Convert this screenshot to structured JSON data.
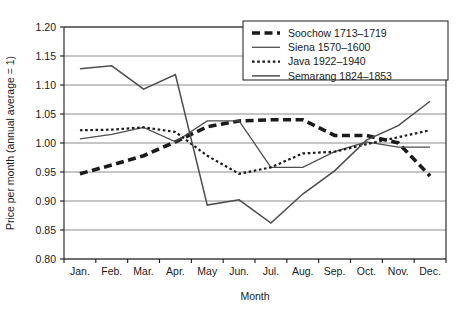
{
  "chart_data": {
    "type": "line",
    "title": "",
    "subtitle": "",
    "xlabel": "Month",
    "ylabel": "Price per month (annual average = 1)",
    "categories": [
      "Jan.",
      "Feb.",
      "Mar.",
      "Apr.",
      "May",
      "Jun.",
      "Jul.",
      "Aug.",
      "Sep.",
      "Oct.",
      "Nov.",
      "Dec."
    ],
    "ylim": [
      0.8,
      1.2
    ],
    "yticks": [
      "0.80",
      "0.85",
      "0.90",
      "0.95",
      "1.00",
      "1.05",
      "1.10",
      "1.15",
      "1.20"
    ],
    "ytick_values": [
      0.8,
      0.85,
      0.9,
      0.95,
      1.0,
      1.05,
      1.1,
      1.15,
      1.2
    ],
    "grid": "horizontal",
    "legend_position": "top-right",
    "series": [
      {
        "name": "Soochow 1713-1719",
        "style": "thick-dashed",
        "color": "#1a1a1a",
        "values": [
          0.947,
          0.962,
          0.978,
          1.002,
          1.028,
          1.038,
          1.04,
          1.04,
          1.013,
          1.013,
          1.0,
          0.943
        ]
      },
      {
        "name": "Siena 1570-1600",
        "style": "solid",
        "color": "#4d4d4d",
        "values": [
          1.007,
          1.015,
          1.027,
          1.002,
          1.038,
          1.038,
          0.958,
          0.958,
          0.985,
          1.002,
          0.993,
          0.993
        ]
      },
      {
        "name": "Java 1922-1940",
        "style": "dotted",
        "color": "#1a1a1a",
        "values": [
          1.022,
          1.023,
          1.027,
          1.019,
          0.978,
          0.947,
          0.958,
          0.982,
          0.985,
          0.998,
          1.01,
          1.022
        ]
      },
      {
        "name": "Semarang 1824-1853",
        "style": "solid-thick",
        "color": "#4d4d4d",
        "values": [
          1.128,
          1.133,
          1.093,
          1.118,
          0.893,
          0.902,
          0.862,
          0.912,
          0.952,
          1.005,
          1.03,
          1.072
        ]
      }
    ]
  },
  "axes": {
    "y_title": "Price per month (annual average = 1)",
    "x_title": "Month",
    "y_tick_labels": [
      "1.20",
      "1.15",
      "1.10",
      "1.05",
      "1.00",
      "0.95",
      "0.90",
      "0.85",
      "0.80"
    ],
    "x_tick_labels": [
      "Jan.",
      "Feb.",
      "Mar.",
      "Apr.",
      "May",
      "Jun.",
      "Jul.",
      "Aug.",
      "Sep.",
      "Oct.",
      "Nov.",
      "Dec."
    ]
  },
  "legend": {
    "entries": [
      {
        "label": "Soochow 1713–1719",
        "swatch": "thick-dashed-swatch"
      },
      {
        "label": "Siena 1570–1600",
        "swatch": "solid-swatch"
      },
      {
        "label": "Java 1922–1940",
        "swatch": "dotted-swatch"
      },
      {
        "label": "Semarang 1824–1853",
        "swatch": "solid-thick-swatch"
      }
    ]
  },
  "style": {
    "grid_color": "#8c8c8c",
    "axis_color": "#1a1a1a",
    "background": "#ffffff",
    "series_dark": "#1a1a1a",
    "series_gray": "#4d4d4d"
  }
}
